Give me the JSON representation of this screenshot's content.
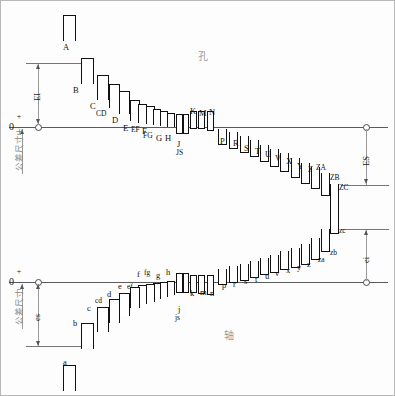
{
  "diagram": {
    "hole_region_label": "孔",
    "shaft_region_label": "轴",
    "upper_zero_label": "0",
    "lower_zero_label": "0",
    "plus_sign": "+",
    "minus_sign": "−",
    "upper_axis_caption": "公差尺寸+",
    "lower_axis_caption": "公差尺寸",
    "deviation_labels": {
      "EI": "EI",
      "ES": "ES",
      "es": "es",
      "ei": "ei"
    }
  },
  "chart_data": {
    "type": "bar",
    "xlabel": "",
    "ylabel": "公差尺寸",
    "grid": false,
    "legend": "none",
    "annotations": [
      "EI",
      "ES",
      "es",
      "ei",
      "孔",
      "轴",
      "0",
      "+",
      "−"
    ],
    "series": [
      {
        "name": "孔 (holes, uppercase)",
        "categories": [
          "A",
          "B",
          "C",
          "CD",
          "D",
          "E",
          "EF",
          "F",
          "FG",
          "G",
          "H",
          "J",
          "JS",
          "K",
          "M",
          "N",
          "P",
          "R",
          "S",
          "T",
          "U",
          "V",
          "X",
          "Y",
          "Z",
          "ZA",
          "ZB",
          "ZC"
        ],
        "bands": [
          {
            "label": "A",
            "x": 62,
            "y": 14,
            "w": 13,
            "h": 26,
            "side": "above",
            "lx": 62,
            "ly": 42
          },
          {
            "label": "B",
            "x": 80,
            "y": 57,
            "w": 13,
            "h": 26,
            "side": "above",
            "lx": 72,
            "ly": 85
          },
          {
            "label": "C",
            "x": 96,
            "y": 74,
            "w": 12,
            "h": 25,
            "side": "above",
            "lx": 89,
            "ly": 101
          },
          {
            "label": "CD",
            "x": 108,
            "y": 83,
            "w": 11,
            "h": 24,
            "side": "above",
            "lx": 95,
            "ly": 109
          },
          {
            "label": "D",
            "x": 118,
            "y": 90,
            "w": 11,
            "h": 23,
            "side": "above",
            "lx": 111,
            "ly": 115
          },
          {
            "label": "E",
            "x": 129,
            "y": 99,
            "w": 10,
            "h": 21,
            "side": "above",
            "lx": 122,
            "ly": 123
          },
          {
            "label": "EF",
            "x": 137,
            "y": 103,
            "w": 9,
            "h": 19,
            "side": "above",
            "lx": 130,
            "ly": 125
          },
          {
            "label": "F",
            "x": 145,
            "y": 105,
            "w": 9,
            "h": 18,
            "side": "above",
            "lx": 141,
            "ly": 126
          },
          {
            "label": "FG",
            "x": 152,
            "y": 108,
            "w": 8,
            "h": 16,
            "side": "above",
            "lx": 142,
            "ly": 131
          },
          {
            "label": "G",
            "x": 159,
            "y": 110,
            "w": 8,
            "h": 15,
            "side": "above",
            "lx": 155,
            "ly": 133
          },
          {
            "label": "H",
            "x": 166,
            "y": 112,
            "w": 8,
            "h": 14,
            "side": "above",
            "lx": 164,
            "ly": 133
          },
          {
            "label": "J",
            "x": 175,
            "y": 113,
            "w": 7,
            "h": 20,
            "side": "straddle",
            "lx": 176,
            "ly": 139
          },
          {
            "label": "JS",
            "x": 182,
            "y": 113,
            "w": 6,
            "h": 20,
            "side": "straddle",
            "lx": 175,
            "ly": 148
          },
          {
            "label": "K",
            "x": 189,
            "y": 110,
            "w": 7,
            "h": 18,
            "side": "straddle",
            "lx": 189,
            "ly": 106
          },
          {
            "label": "M",
            "x": 197,
            "y": 110,
            "w": 7,
            "h": 18,
            "side": "straddle",
            "lx": 198,
            "ly": 108
          },
          {
            "label": "N",
            "x": 206,
            "y": 110,
            "w": 7,
            "h": 20,
            "side": "straddle",
            "lx": 208,
            "ly": 107
          },
          {
            "label": "P",
            "x": 217,
            "y": 128,
            "w": 9,
            "h": 16,
            "side": "below",
            "lx": 219,
            "ly": 136
          },
          {
            "label": "R",
            "x": 228,
            "y": 131,
            "w": 9,
            "h": 17,
            "side": "below",
            "lx": 232,
            "ly": 138
          },
          {
            "label": "S",
            "x": 239,
            "y": 135,
            "w": 9,
            "h": 17,
            "side": "below",
            "lx": 243,
            "ly": 143
          },
          {
            "label": "T",
            "x": 249,
            "y": 139,
            "w": 9,
            "h": 17,
            "side": "below",
            "lx": 254,
            "ly": 146
          },
          {
            "label": "U",
            "x": 259,
            "y": 144,
            "w": 9,
            "h": 17,
            "side": "below",
            "lx": 264,
            "ly": 149
          },
          {
            "label": "V",
            "x": 269,
            "y": 148,
            "w": 9,
            "h": 18,
            "side": "below",
            "lx": 274,
            "ly": 153
          },
          {
            "label": "X",
            "x": 279,
            "y": 152,
            "w": 9,
            "h": 19,
            "side": "below",
            "lx": 285,
            "ly": 156
          },
          {
            "label": "Y",
            "x": 290,
            "y": 157,
            "w": 9,
            "h": 20,
            "side": "below",
            "lx": 296,
            "ly": 161
          },
          {
            "label": "Z",
            "x": 300,
            "y": 162,
            "w": 9,
            "h": 21,
            "side": "below",
            "lx": 307,
            "ly": 164
          },
          {
            "label": "ZA",
            "x": 310,
            "y": 166,
            "w": 9,
            "h": 22,
            "side": "below",
            "lx": 315,
            "ly": 163
          },
          {
            "label": "ZB",
            "x": 320,
            "y": 172,
            "w": 9,
            "h": 23,
            "side": "below",
            "lx": 329,
            "ly": 173
          },
          {
            "label": "ZC",
            "x": 329,
            "y": 183,
            "w": 9,
            "h": 26,
            "side": "below",
            "lx": 338,
            "ly": 183
          }
        ]
      },
      {
        "name": "轴 (shafts, lowercase)",
        "categories": [
          "a",
          "b",
          "c",
          "cd",
          "d",
          "e",
          "ef",
          "f",
          "fg",
          "g",
          "h",
          "j",
          "js",
          "k",
          "m",
          "n",
          "p",
          "r",
          "s",
          "t",
          "u",
          "v",
          "x",
          "y",
          "z",
          "za",
          "zb",
          "zc"
        ],
        "bands": [
          {
            "label": "zc",
            "x": 329,
            "y": 207,
            "w": 9,
            "h": 26,
            "side": "above",
            "lx": 338,
            "ly": 226
          },
          {
            "label": "zb",
            "x": 320,
            "y": 228,
            "w": 9,
            "h": 23,
            "side": "above",
            "lx": 329,
            "ly": 248
          },
          {
            "label": "za",
            "x": 310,
            "y": 237,
            "w": 9,
            "h": 22,
            "side": "above",
            "lx": 317,
            "ly": 255
          },
          {
            "label": "z",
            "x": 300,
            "y": 243,
            "w": 9,
            "h": 21,
            "side": "above",
            "lx": 306,
            "ly": 259
          },
          {
            "label": "y",
            "x": 290,
            "y": 247,
            "w": 9,
            "h": 20,
            "side": "above",
            "lx": 296,
            "ly": 262
          },
          {
            "label": "x",
            "x": 279,
            "y": 250,
            "w": 9,
            "h": 19,
            "side": "above",
            "lx": 285,
            "ly": 265
          },
          {
            "label": "v",
            "x": 269,
            "y": 254,
            "w": 9,
            "h": 18,
            "side": "above",
            "lx": 274,
            "ly": 268
          },
          {
            "label": "u",
            "x": 259,
            "y": 257,
            "w": 9,
            "h": 17,
            "side": "above",
            "lx": 264,
            "ly": 271
          },
          {
            "label": "t",
            "x": 249,
            "y": 260,
            "w": 9,
            "h": 17,
            "side": "above",
            "lx": 254,
            "ly": 274
          },
          {
            "label": "s",
            "x": 239,
            "y": 263,
            "w": 9,
            "h": 17,
            "side": "above",
            "lx": 243,
            "ly": 276
          },
          {
            "label": "r",
            "x": 228,
            "y": 265,
            "w": 9,
            "h": 17,
            "side": "above",
            "lx": 232,
            "ly": 279
          },
          {
            "label": "p",
            "x": 217,
            "y": 268,
            "w": 9,
            "h": 16,
            "side": "above",
            "lx": 221,
            "ly": 280
          },
          {
            "label": "n",
            "x": 206,
            "y": 274,
            "w": 7,
            "h": 20,
            "side": "straddle",
            "lx": 209,
            "ly": 288
          },
          {
            "label": "m",
            "x": 197,
            "y": 274,
            "w": 7,
            "h": 19,
            "side": "straddle",
            "lx": 199,
            "ly": 287
          },
          {
            "label": "k",
            "x": 189,
            "y": 274,
            "w": 7,
            "h": 18,
            "side": "straddle",
            "lx": 189,
            "ly": 288
          },
          {
            "label": "js",
            "x": 182,
            "y": 272,
            "w": 6,
            "h": 20,
            "side": "straddle",
            "lx": 174,
            "ly": 313
          },
          {
            "label": "j",
            "x": 175,
            "y": 272,
            "w": 7,
            "h": 20,
            "side": "straddle",
            "lx": 177,
            "ly": 304
          },
          {
            "label": "h",
            "x": 166,
            "y": 280,
            "w": 8,
            "h": 14,
            "side": "below",
            "lx": 165,
            "ly": 267
          },
          {
            "label": "g",
            "x": 159,
            "y": 281,
            "w": 8,
            "h": 15,
            "side": "below",
            "lx": 155,
            "ly": 270
          },
          {
            "label": "fg",
            "x": 152,
            "y": 282,
            "w": 8,
            "h": 16,
            "side": "below",
            "lx": 143,
            "ly": 268
          },
          {
            "label": "f",
            "x": 145,
            "y": 283,
            "w": 9,
            "h": 18,
            "side": "below",
            "lx": 136,
            "ly": 269
          },
          {
            "label": "ef",
            "x": 137,
            "y": 284,
            "w": 9,
            "h": 19,
            "side": "below",
            "lx": 126,
            "ly": 282
          },
          {
            "label": "e",
            "x": 129,
            "y": 286,
            "w": 10,
            "h": 21,
            "side": "below",
            "lx": 117,
            "ly": 281
          },
          {
            "label": "d",
            "x": 118,
            "y": 292,
            "w": 11,
            "h": 23,
            "side": "below",
            "lx": 106,
            "ly": 289
          },
          {
            "label": "cd",
            "x": 108,
            "y": 298,
            "w": 11,
            "h": 24,
            "side": "below",
            "lx": 94,
            "ly": 296
          },
          {
            "label": "c",
            "x": 96,
            "y": 306,
            "w": 12,
            "h": 25,
            "side": "below",
            "lx": 86,
            "ly": 303
          },
          {
            "label": "b",
            "x": 80,
            "y": 322,
            "w": 13,
            "h": 26,
            "side": "below",
            "lx": 72,
            "ly": 318
          },
          {
            "label": "a",
            "x": 62,
            "y": 364,
            "w": 13,
            "h": 26,
            "side": "below",
            "lx": 62,
            "ly": 357
          }
        ]
      }
    ]
  }
}
